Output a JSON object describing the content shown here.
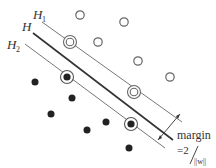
{
  "labels": {
    "h1": "H",
    "h1_sub": "1",
    "h": "H",
    "h2": "H",
    "h2_sub": "2",
    "margin": "margin",
    "formula_eq": "=2",
    "formula_den": "||w||"
  },
  "points": {
    "open": [
      {
        "x": 80,
        "y": 15
      },
      {
        "x": 124,
        "y": 22
      },
      {
        "x": 98,
        "y": 42
      },
      {
        "x": 138,
        "y": 61
      },
      {
        "x": 170,
        "y": 77
      }
    ],
    "open_support": [
      {
        "x": 70,
        "y": 42
      },
      {
        "x": 134,
        "y": 92
      }
    ],
    "filled": [
      {
        "x": 35,
        "y": 82
      },
      {
        "x": 72,
        "y": 98
      },
      {
        "x": 51,
        "y": 114
      },
      {
        "x": 87,
        "y": 130
      },
      {
        "x": 106,
        "y": 122
      },
      {
        "x": 129,
        "y": 148
      }
    ],
    "filled_support": [
      {
        "x": 67,
        "y": 77
      },
      {
        "x": 131,
        "y": 124
      }
    ]
  },
  "colors": {
    "stroke": "#555555",
    "dark": "#222222"
  }
}
